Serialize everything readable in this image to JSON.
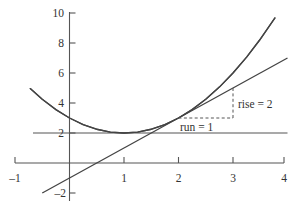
{
  "chart_data": {
    "type": "line",
    "title": "",
    "xlabel": "",
    "ylabel": "",
    "xlim": [
      -1,
      4
    ],
    "ylim": [
      -2,
      10
    ],
    "grid": false,
    "legend": "none",
    "xticks": [
      -1,
      1,
      2,
      3,
      4
    ],
    "xtick_labels": [
      "–1",
      "1",
      "2",
      "3",
      "4"
    ],
    "yticks": [
      -2,
      2,
      4,
      6,
      8,
      10
    ],
    "ytick_labels": [
      "–2",
      "2",
      "4",
      "6",
      "8",
      "10"
    ],
    "series": [
      {
        "name": "parabola",
        "equation": "y = (x - 1)^2 + 2",
        "style": "solid",
        "x_range": [
          -0.72,
          3.77
        ],
        "points_x": [
          -0.72,
          -0.5,
          -0.25,
          0,
          0.25,
          0.5,
          0.75,
          1,
          1.25,
          1.5,
          1.75,
          2,
          2.25,
          2.5,
          2.75,
          3,
          3.25,
          3.5,
          3.77
        ],
        "points_y": [
          4.96,
          4.25,
          3.56,
          3,
          2.56,
          2.25,
          2.06,
          2,
          2.06,
          2.25,
          2.56,
          3,
          3.56,
          4.25,
          5.06,
          6,
          7.06,
          8.25,
          9.67
        ]
      },
      {
        "name": "tangent-line",
        "equation": "y = 2x - 1",
        "style": "solid",
        "x_range": [
          -0.5,
          4
        ],
        "points_x": [
          -0.5,
          4
        ],
        "points_y": [
          -2,
          7
        ],
        "tangent_point": [
          2,
          3
        ]
      },
      {
        "name": "horizontal-line",
        "equation": "y = 2",
        "style": "solid",
        "x_range": [
          -1,
          4
        ],
        "points_x": [
          -1,
          4
        ],
        "points_y": [
          2,
          2
        ]
      }
    ],
    "annotations": [
      {
        "name": "rise",
        "label": "rise = 2",
        "value": 2,
        "style": "dashed",
        "from": [
          3,
          3
        ],
        "to": [
          3,
          5
        ],
        "label_at": [
          3.12,
          4.1
        ]
      },
      {
        "name": "run",
        "label": "run = 1",
        "value": 1,
        "style": "dashed",
        "from": [
          2,
          3
        ],
        "to": [
          3,
          3
        ],
        "label_at": [
          2.05,
          2.45
        ]
      }
    ],
    "colors": {
      "axis": "#555555",
      "curve": "#444444",
      "dashed": "#555555",
      "text": "#333333",
      "background": "#ffffff"
    }
  },
  "labels": {
    "rise": "rise = 2",
    "run": "run = 1",
    "x_m1": "–1",
    "x_1": "1",
    "x_2": "2",
    "x_3": "3",
    "x_4": "4",
    "y_m2": "–2",
    "y_2": "2",
    "y_4": "4",
    "y_6": "6",
    "y_8": "8",
    "y_10": "10"
  }
}
